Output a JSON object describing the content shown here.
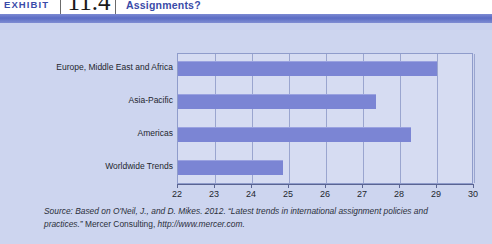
{
  "header": {
    "kicker": "EXHIBIT",
    "number": "11.4",
    "title": "Assignments?"
  },
  "source": {
    "lead": "Source: Based on O'Neil, J., and D. Mikes. 2012. “Latest trends in international assignment policies and practices.”",
    "publisher": "Mercer Consulting,",
    "url": "http://www.mercer.com."
  },
  "colors": {
    "bar": "#7b85d4",
    "plot_background": "#d6dcf2",
    "page_background": "#cdd5ef",
    "accent": "#3a4ba8",
    "gridline": "#9aa5cf"
  },
  "chart_data": {
    "type": "bar",
    "orientation": "horizontal",
    "title": "",
    "xlabel": "",
    "ylabel": "",
    "categories": [
      "Europe, Middle East and Africa",
      "Asia-Pacific",
      "Americas",
      "Worldwide Trends"
    ],
    "values": [
      29.0,
      27.35,
      28.3,
      24.85
    ],
    "xlim": [
      22,
      30
    ],
    "xticks": [
      22,
      23,
      24,
      25,
      26,
      27,
      28,
      29,
      30
    ],
    "xticklabels": [
      "22",
      "23",
      "24",
      "25",
      "26",
      "27",
      "28",
      "29",
      "30"
    ],
    "grid": true,
    "legend": false
  }
}
